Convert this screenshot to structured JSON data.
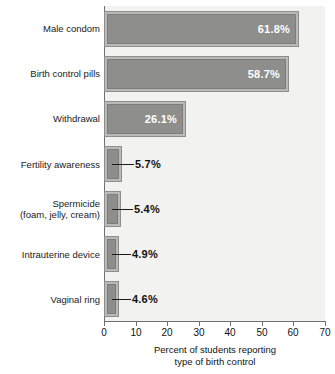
{
  "chart_data": {
    "type": "bar",
    "orientation": "horizontal",
    "title": "",
    "xlabel": "Percent of students reporting\ntype of birth control",
    "ylabel": "",
    "xlim": [
      0,
      70
    ],
    "xticks": [
      0,
      10,
      20,
      30,
      40,
      50,
      60,
      70
    ],
    "xtick_labels": [
      "0",
      "10",
      "20",
      "30",
      "40",
      "50",
      "60",
      "70"
    ],
    "grid": false,
    "legend": null,
    "categories": [
      "Male condom",
      "Birth control pills",
      "Withdrawal",
      "Fertility awareness",
      "Spermicide\n(foam, jelly, cream)",
      "Intrauterine device",
      "Vaginal ring"
    ],
    "values": [
      61.8,
      58.7,
      26.1,
      5.7,
      5.4,
      4.9,
      4.6
    ],
    "value_labels": [
      "61.8%",
      "58.7%",
      "26.1%",
      "5.7%",
      "5.4%",
      "4.9%",
      "4.6%"
    ],
    "label_placement": [
      "inside",
      "inside",
      "inside",
      "outside",
      "outside",
      "outside",
      "outside"
    ],
    "colors": {
      "bar_fill": "#8e8e8c",
      "bar_border_outer": "#b9b9b7",
      "bar_border_line": "#7c7c7a",
      "plot_background": "#f2f2f0",
      "axis": "#6f6f6f",
      "text": "#111111",
      "inside_label_text": "#ffffff"
    }
  },
  "bars": [
    {
      "label": "Male condom",
      "value": 61.8,
      "value_label": "61.8%",
      "placement": "inside"
    },
    {
      "label": "Birth control pills",
      "value": 58.7,
      "value_label": "58.7%",
      "placement": "inside"
    },
    {
      "label": "Withdrawal",
      "value": 26.1,
      "value_label": "26.1%",
      "placement": "inside"
    },
    {
      "label": "Fertility awareness",
      "value": 5.7,
      "value_label": "5.7%",
      "placement": "outside"
    },
    {
      "label": "Spermicide\n(foam, jelly, cream)",
      "value": 5.4,
      "value_label": "5.4%",
      "placement": "outside"
    },
    {
      "label": "Intrauterine device",
      "value": 4.9,
      "value_label": "4.9%",
      "placement": "outside"
    },
    {
      "label": "Vaginal ring",
      "value": 4.6,
      "value_label": "4.6%",
      "placement": "outside"
    }
  ],
  "axis": {
    "ticks": [
      "0",
      "10",
      "20",
      "30",
      "40",
      "50",
      "60",
      "70"
    ],
    "title": "Percent of students reporting\ntype of birth control"
  }
}
